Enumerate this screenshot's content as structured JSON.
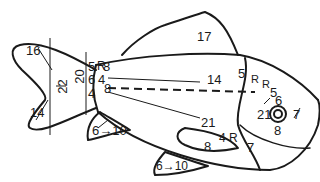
{
  "figure": {
    "stroke_color": "#1a1a1a",
    "background": "#ffffff"
  },
  "labels": {
    "caudal_upper": "16",
    "caudal_lower": "14",
    "caudal_length": "22",
    "peduncle_depth": "20",
    "peduncle_5": "5",
    "peduncle_6": "6",
    "peduncle_4": "4",
    "peduncle_R": "R",
    "peduncle_8_top": "8",
    "peduncle_4_mid": "4",
    "peduncle_8_bottom": "8",
    "dorsal": "17",
    "lateral_14": "14",
    "lateral_21": "21",
    "back_5": "5",
    "back_R": "R",
    "head_R": "R",
    "head_5": "5",
    "eye_6": "6",
    "eye_21": "21",
    "eye_7": "7",
    "eye_8": "8",
    "anal_fin": "6→10",
    "pelvic_fin": "6→10",
    "pectoral_8": "8",
    "pectoral_4R": "4 R",
    "operculum_7": "7"
  }
}
